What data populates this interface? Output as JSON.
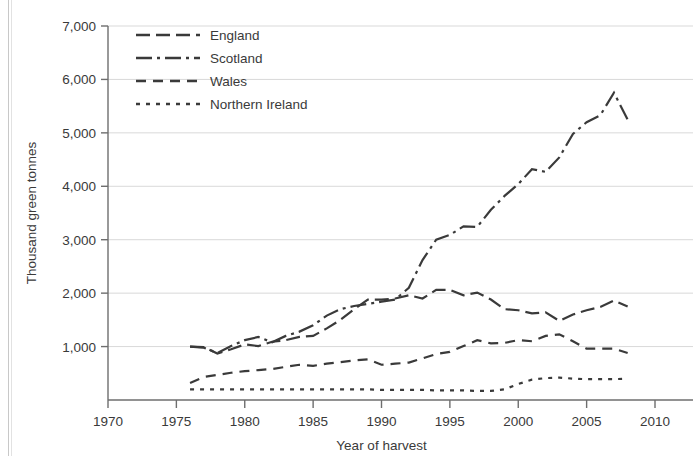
{
  "chart_data": {
    "type": "line",
    "title": "",
    "xlabel": "Year of harvest",
    "ylabel": "Thousand green tonnes",
    "xlim": [
      1970,
      2010
    ],
    "ylim": [
      0,
      7000
    ],
    "xticks": [
      1970,
      1975,
      1980,
      1985,
      1990,
      1995,
      2000,
      2005,
      2010
    ],
    "xtick_labels": [
      "1970",
      "1975",
      "1980",
      "1985",
      "1990",
      "1995",
      "2000",
      "2005",
      "2010"
    ],
    "yticks": [
      1000,
      2000,
      3000,
      4000,
      5000,
      6000,
      7000
    ],
    "ytick_labels": [
      "1,000",
      "2,000",
      "3,000",
      "4,000",
      "5,000",
      "6,000",
      "7,000"
    ],
    "grid": "horizontal",
    "legend_position": "top-left",
    "line_color": "#3a3a3a",
    "grid_color": "#d9d9d9",
    "axis_color": "#6e6e6e",
    "series": [
      {
        "name": "England",
        "dash": "14,6",
        "x": [
          1976,
          1977,
          1978,
          1979,
          1980,
          1981,
          1982,
          1983,
          1984,
          1985,
          1986,
          1987,
          1988,
          1989,
          1990,
          1991,
          1992,
          1993,
          1994,
          1995,
          1996,
          1997,
          1998,
          1999,
          2000,
          2001,
          2002,
          2003,
          2004,
          2005,
          2006,
          2007,
          2008
        ],
        "values": [
          1000,
          990,
          870,
          950,
          1040,
          1010,
          1090,
          1120,
          1180,
          1200,
          1340,
          1500,
          1700,
          1880,
          1880,
          1900,
          1960,
          1900,
          2060,
          2060,
          1960,
          2010,
          1880,
          1700,
          1680,
          1620,
          1640,
          1480,
          1600,
          1680,
          1740,
          1860,
          1750
        ]
      },
      {
        "name": "Scotland",
        "dash": "16,5,3,5",
        "x": [
          1976,
          1977,
          1978,
          1979,
          1980,
          1981,
          1982,
          1983,
          1984,
          1985,
          1986,
          1987,
          1988,
          1989,
          1990,
          1991,
          1992,
          1993,
          1994,
          1995,
          1996,
          1997,
          1998,
          1999,
          2000,
          2001,
          2002,
          2003,
          2004,
          2005,
          2006,
          2007,
          2008
        ],
        "values": [
          1000,
          980,
          880,
          1010,
          1120,
          1180,
          1080,
          1200,
          1280,
          1400,
          1580,
          1700,
          1760,
          1800,
          1840,
          1880,
          2100,
          2620,
          3000,
          3090,
          3250,
          3240,
          3560,
          3820,
          4040,
          4320,
          4270,
          4540,
          4980,
          5200,
          5330,
          5750,
          5250
        ]
      },
      {
        "name": "Wales",
        "dash": "10,7",
        "x": [
          1976,
          1977,
          1978,
          1979,
          1980,
          1981,
          1982,
          1983,
          1984,
          1985,
          1986,
          1987,
          1988,
          1989,
          1990,
          1991,
          1992,
          1993,
          1994,
          1995,
          1996,
          1997,
          1998,
          1999,
          2000,
          2001,
          2002,
          2003,
          2004,
          2005,
          2006,
          2007,
          2008
        ],
        "values": [
          320,
          430,
          470,
          510,
          540,
          560,
          580,
          620,
          660,
          640,
          680,
          710,
          740,
          760,
          660,
          680,
          700,
          780,
          860,
          900,
          1010,
          1120,
          1060,
          1070,
          1120,
          1100,
          1200,
          1230,
          1100,
          960,
          960,
          960,
          880
        ]
      },
      {
        "name": "Northern Ireland",
        "dash": "4,6",
        "x": [
          1976,
          1977,
          1978,
          1979,
          1980,
          1981,
          1982,
          1983,
          1984,
          1985,
          1986,
          1987,
          1988,
          1989,
          1990,
          1991,
          1992,
          1993,
          1994,
          1995,
          1996,
          1997,
          1998,
          1999,
          2000,
          2001,
          2002,
          2003,
          2004,
          2005,
          2006,
          2007,
          2008
        ],
        "values": [
          200,
          200,
          200,
          200,
          200,
          200,
          200,
          200,
          200,
          200,
          200,
          200,
          200,
          200,
          190,
          190,
          190,
          190,
          180,
          180,
          180,
          170,
          170,
          200,
          300,
          380,
          410,
          420,
          400,
          390,
          390,
          390,
          400
        ]
      }
    ]
  },
  "legend": {
    "items": [
      {
        "label": "England",
        "dash": "14,6"
      },
      {
        "label": "Scotland",
        "dash": "16,5,3,5"
      },
      {
        "label": "Wales",
        "dash": "10,7"
      },
      {
        "label": "Northern Ireland",
        "dash": "4,6"
      }
    ]
  }
}
